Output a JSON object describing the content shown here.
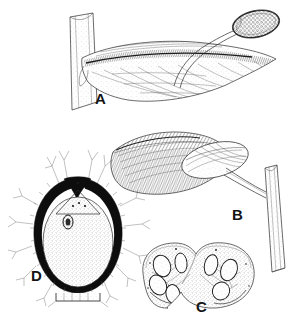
{
  "figure": {
    "kind": "botanical-line-drawing",
    "background_color": "#ffffff",
    "ink_color": "#1a1a1a",
    "width": 305,
    "height": 326,
    "panels": [
      {
        "id": "A",
        "label": "A",
        "label_x": 95,
        "label_y": 104,
        "description": "Leaf-like bract on a stem bearing a stalked club-shaped spadix head"
      },
      {
        "id": "B",
        "label": "B",
        "label_x": 232,
        "label_y": 220,
        "description": "Elongated hatched spathe with overlapping oval bract attached to a curved stem"
      },
      {
        "id": "C",
        "label": "C",
        "label_x": 196,
        "label_y": 312,
        "description": "Transverse section of bilobed ovary showing ovules in stippled tissue"
      },
      {
        "id": "D",
        "label": "D",
        "label_x": 31,
        "label_y": 281,
        "description": "Longitudinal section of ovule with black integument, stippled nucellus, embryo and branched hairs"
      }
    ]
  }
}
